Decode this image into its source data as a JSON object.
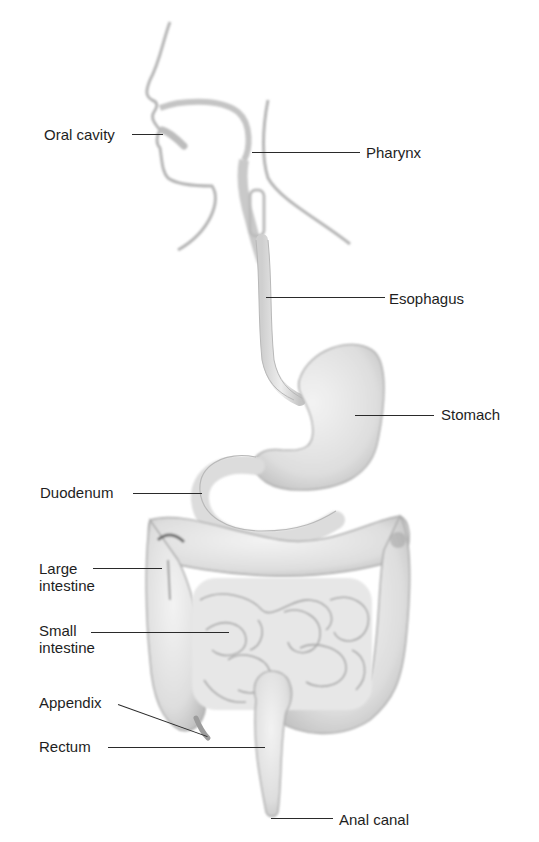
{
  "diagram": {
    "colors": {
      "organ_fill": "#e6e6e6",
      "organ_shade": "#b9b9b9",
      "organ_outline": "#a8a8a8",
      "label_text": "#1e1e1e",
      "leader_line": "#2a2a2a",
      "background": "#ffffff"
    },
    "labels": [
      {
        "id": "oral-cavity",
        "text": "Oral cavity",
        "x": 44,
        "y": 126,
        "line": {
          "x1": 132,
          "y1": 134,
          "x2": 163,
          "y2": 134
        }
      },
      {
        "id": "pharynx",
        "text": "Pharynx",
        "x": 366,
        "y": 144,
        "line": {
          "x1": 252,
          "y1": 152,
          "x2": 360,
          "y2": 152
        }
      },
      {
        "id": "esophagus",
        "text": "Esophagus",
        "x": 389,
        "y": 290,
        "line": {
          "x1": 266,
          "y1": 297,
          "x2": 385,
          "y2": 297
        }
      },
      {
        "id": "stomach",
        "text": "Stomach",
        "x": 441,
        "y": 406,
        "line": {
          "x1": 355,
          "y1": 415,
          "x2": 434,
          "y2": 415
        }
      },
      {
        "id": "duodenum",
        "text": "Duodenum",
        "x": 40,
        "y": 484,
        "line": {
          "x1": 133,
          "y1": 493,
          "x2": 202,
          "y2": 493
        }
      },
      {
        "id": "large-intestine",
        "text": "Large\nintestine",
        "x": 39,
        "y": 560,
        "line": {
          "x1": 93,
          "y1": 568,
          "x2": 162,
          "y2": 568
        }
      },
      {
        "id": "small-intestine",
        "text": "Small\nintestine",
        "x": 39,
        "y": 622,
        "line": {
          "x1": 91,
          "y1": 632,
          "x2": 229,
          "y2": 632
        }
      },
      {
        "id": "appendix",
        "text": "Appendix",
        "x": 39,
        "y": 694,
        "line": {
          "x1": 118,
          "y1": 704,
          "x2": 207,
          "y2": 736
        }
      },
      {
        "id": "rectum",
        "text": "Rectum",
        "x": 39,
        "y": 738,
        "line": {
          "x1": 108,
          "y1": 747,
          "x2": 265,
          "y2": 747
        }
      },
      {
        "id": "anal-canal",
        "text": "Anal canal",
        "x": 339,
        "y": 811,
        "line": {
          "x1": 271,
          "y1": 818,
          "x2": 333,
          "y2": 818
        }
      }
    ]
  }
}
